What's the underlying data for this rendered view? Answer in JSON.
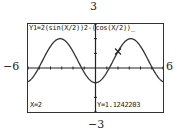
{
  "window": {
    "ymax_label": "3",
    "ymin_label": "−3",
    "xmin_label": "−6",
    "xmax_label": "6"
  },
  "calculator_screen": {
    "formula": "Y1=2(sin(X/2))2-(cos(X/2))_",
    "trace_x": "X=2",
    "trace_y": "Y=1.1242203",
    "cursor_icon": "x-mark-cursor"
  },
  "chart_data": {
    "type": "line",
    "xlabel": "",
    "ylabel": "",
    "xlim": [
      -6,
      6
    ],
    "ylim": [
      -3,
      3
    ],
    "grid": false,
    "series": [
      {
        "name": "Y1",
        "x": [
          -6,
          -5,
          -4,
          -3.1416,
          -3,
          -2,
          -1.23,
          -1,
          0,
          1,
          1.23,
          2,
          3,
          3.1416,
          4,
          5,
          6
        ],
        "y": [
          0.88,
          1.76,
          1.62,
          2.0,
          1.98,
          1.12,
          0.0,
          -0.12,
          -1.0,
          -0.12,
          0.0,
          1.12,
          1.98,
          2.0,
          1.62,
          1.76,
          0.88
        ]
      }
    ],
    "trace_point": {
      "x": 2,
      "y": 1.1242203
    },
    "x_tick_step": 1,
    "y_tick_step": 1
  }
}
